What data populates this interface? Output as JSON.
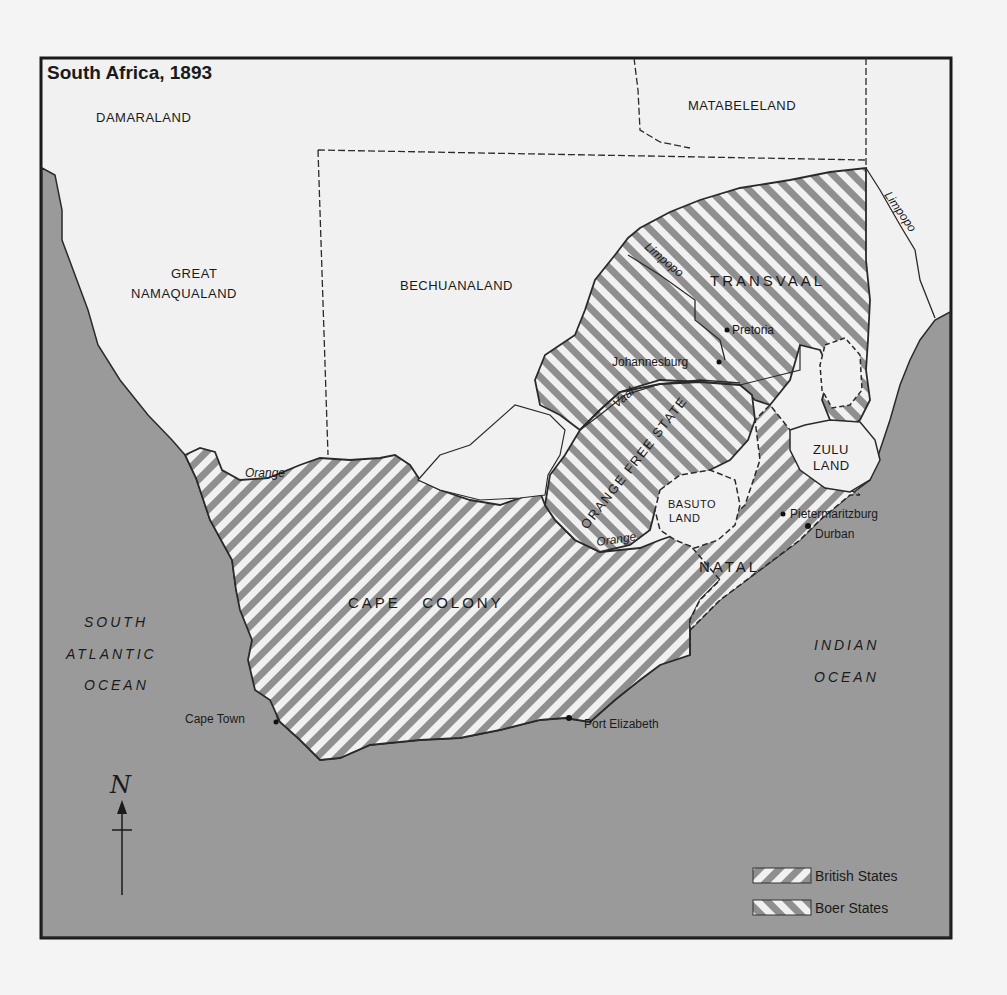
{
  "map": {
    "title": "South Africa, 1893",
    "colors": {
      "background": "#f4f4f4",
      "land": "#f1f1f1",
      "ocean": "#9a9a9a",
      "border": "#2a2a2a",
      "hatch_stripe": "#8c8c8c"
    },
    "regions": {
      "damaraland": "DAMARALAND",
      "matabeleland": "MATABELELAND",
      "great": "GREAT",
      "namaqualand": "NAMAQUALAND",
      "bechuanaland": "BECHUANALAND",
      "transvaal": "TRANSVAAL",
      "orange_free_state": "ORANGE FREE STATE",
      "zulu": "ZULU",
      "zulu_land": "LAND",
      "basuto": "BASUTO",
      "basuto_land": "LAND",
      "natal": "NATAL",
      "cape_colony": "CAPE   COLONY"
    },
    "oceans": {
      "south_atlantic_1": "SOUTH",
      "south_atlantic_2": "ATLANTIC",
      "south_atlantic_3": "OCEAN",
      "indian_1": "INDIAN",
      "indian_2": "OCEAN"
    },
    "rivers": {
      "limpopo_north": "Limpopo",
      "limpopo_west": "Limpopo",
      "vaal": "Vaal",
      "orange_west": "Orange",
      "orange_east": "Orange"
    },
    "cities": {
      "pretoria": "Pretoria",
      "johannesburg": "Johannesburg",
      "pietermaritzburg": "Pietermaritzburg",
      "durban": "Durban",
      "cape_town": "Cape Town",
      "port_elizabeth": "Port Elizabeth"
    },
    "compass": {
      "label": "N"
    },
    "legend": {
      "items": [
        {
          "label": "British States",
          "pattern": "hatch-back"
        },
        {
          "label": "Boer States",
          "pattern": "hatch-forward"
        }
      ]
    }
  }
}
